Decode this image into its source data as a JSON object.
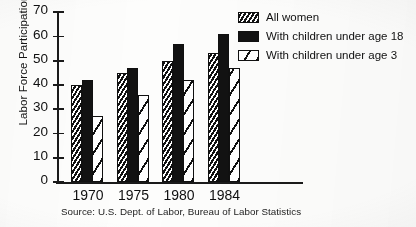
{
  "chart_data": {
    "type": "bar",
    "title": "",
    "xlabel": "",
    "ylabel": "Labor Force Participation Rate",
    "categories": [
      "1970",
      "1975",
      "1980",
      "1984"
    ],
    "series": [
      {
        "name": "All women",
        "values": [
          40,
          45,
          50,
          53
        ],
        "fill": "hatch-dense"
      },
      {
        "name": "With children under age 18",
        "values": [
          42,
          47,
          57,
          61
        ],
        "fill": "solid"
      },
      {
        "name": "With children under age 3",
        "values": [
          27,
          36,
          42,
          47
        ],
        "fill": "hatch-open"
      }
    ],
    "ylim": [
      0,
      70
    ],
    "yticks": [
      0,
      10,
      20,
      30,
      40,
      50,
      60,
      70
    ],
    "ytick_labels": [
      "0",
      "10",
      "20",
      "30",
      "40",
      "50",
      "60",
      "70"
    ],
    "grid": false,
    "legend_position": "upper right",
    "source_note": "Source: U.S. Dept. of Labor, Bureau of Labor Statistics",
    "colors": {
      "ink": "#111111",
      "paper": "#fdfdfc"
    }
  },
  "legend": {
    "items": [
      {
        "label": "All women"
      },
      {
        "label": "With children under age 18"
      },
      {
        "label": "With children under age 3"
      }
    ]
  }
}
